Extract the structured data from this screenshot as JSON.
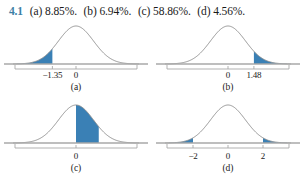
{
  "header": {
    "exercise_number": "4.1",
    "answers": [
      "(a) 8.85%.",
      "(b) 6.94%.",
      "(c) 58.86%.",
      "(d) 4.56%."
    ]
  },
  "colors": {
    "accent_blue": "#3d7fa6",
    "shade_fill": "#3a80b5",
    "curve_stroke": "#8a8a8a",
    "axis_stroke": "#a8a8a8",
    "text": "#1a1a1a",
    "background": "#ffffff"
  },
  "chart_data": [
    {
      "type": "area",
      "id": "a",
      "caption": "(a)",
      "title": "",
      "xlabel": "",
      "ylabel": "",
      "distribution": "standard normal",
      "mean": 0,
      "sd": 1,
      "xlim": [
        -3.6,
        3.6
      ],
      "grid": false,
      "legend": "none",
      "tick_values": [
        -1.35,
        0
      ],
      "tick_labels": [
        "−1.35",
        "0"
      ],
      "shaded_regions": [
        {
          "from": -3.6,
          "to": -1.35,
          "label": "left tail",
          "area_percent": 8.85
        }
      ],
      "annotation": "8.85%"
    },
    {
      "type": "area",
      "id": "b",
      "caption": "(b)",
      "title": "",
      "xlabel": "",
      "ylabel": "",
      "distribution": "standard normal",
      "mean": 0,
      "sd": 1,
      "xlim": [
        -3.6,
        3.6
      ],
      "grid": false,
      "legend": "none",
      "tick_values": [
        0,
        1.48
      ],
      "tick_labels": [
        "0",
        "1.48"
      ],
      "shaded_regions": [
        {
          "from": 1.48,
          "to": 3.6,
          "label": "right tail",
          "area_percent": 6.94
        }
      ],
      "annotation": "6.94%"
    },
    {
      "type": "area",
      "id": "c",
      "caption": "(c)",
      "title": "",
      "xlabel": "",
      "ylabel": "",
      "distribution": "standard normal",
      "mean": 0,
      "sd": 1,
      "xlim": [
        -3.6,
        3.6
      ],
      "grid": false,
      "legend": "none",
      "tick_values": [
        0
      ],
      "tick_labels": [
        "0"
      ],
      "shaded_regions": [
        {
          "from": 0,
          "to": 1.3,
          "label": "center-right region",
          "area_percent": 58.86
        }
      ],
      "annotation": "58.86%"
    },
    {
      "type": "area",
      "id": "d",
      "caption": "(d)",
      "title": "",
      "xlabel": "",
      "ylabel": "",
      "distribution": "standard normal",
      "mean": 0,
      "sd": 1,
      "xlim": [
        -3.6,
        3.6
      ],
      "grid": false,
      "legend": "none",
      "tick_values": [
        -2,
        0,
        2
      ],
      "tick_labels": [
        "−2",
        "0",
        "2"
      ],
      "shaded_regions": [
        {
          "from": -3.6,
          "to": -2,
          "label": "left tail",
          "area_percent": 2.28
        },
        {
          "from": 2,
          "to": 3.6,
          "label": "right tail",
          "area_percent": 2.28
        }
      ],
      "annotation": "4.56%"
    }
  ]
}
